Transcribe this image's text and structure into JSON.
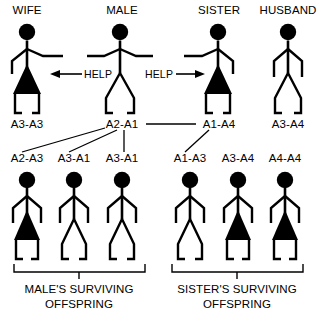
{
  "diagram": {
    "type": "pedigree-kin-selection",
    "width": 321,
    "height": 314,
    "background_color": "#ffffff",
    "ink_color": "#000000"
  },
  "parents": {
    "row_label": "parental generation",
    "figures": [
      {
        "id": "wife",
        "title": "WIFE",
        "sex": "female",
        "genotype": "A3-A3",
        "x": 27,
        "arm_style": "right-extended"
      },
      {
        "id": "male",
        "title": "MALE",
        "sex": "male",
        "genotype": "A2-A1",
        "x": 120,
        "arm_style": "both-extended"
      },
      {
        "id": "sister",
        "title": "SISTER",
        "sex": "female",
        "genotype": "A1-A4",
        "x": 218,
        "arm_style": "left-extended"
      },
      {
        "id": "husband",
        "title": "HUSBAND",
        "sex": "male",
        "genotype": "A3-A4",
        "x": 288,
        "arm_style": "normal"
      }
    ]
  },
  "help_arrows": [
    {
      "id": "help-left",
      "label": "HELP",
      "direction": "left",
      "from": "male",
      "to": "wife"
    },
    {
      "id": "help-right",
      "label": "HELP",
      "direction": "right",
      "from": "male",
      "to": "sister"
    }
  ],
  "mating_link": {
    "from": "A2-A1",
    "to": "A1-A4"
  },
  "offspring": {
    "groups": [
      {
        "id": "male-group",
        "bracket_label_line1": "MALE'S SURVIVING",
        "bracket_label_line2": "OFFSPRING",
        "children": [
          {
            "id": "child-1",
            "genotype": "A2-A3",
            "sex": "female",
            "x": 27
          },
          {
            "id": "child-2",
            "genotype": "A3-A1",
            "sex": "male",
            "x": 74
          },
          {
            "id": "child-3",
            "genotype": "A3-A1",
            "sex": "male",
            "x": 122
          }
        ]
      },
      {
        "id": "sister-group",
        "bracket_label_line1": "SISTER'S SURVIVING",
        "bracket_label_line2": "OFFSPRING",
        "children": [
          {
            "id": "child-4",
            "genotype": "A1-A3",
            "sex": "male",
            "x": 190
          },
          {
            "id": "child-5",
            "genotype": "A3-A4",
            "sex": "female",
            "x": 238
          },
          {
            "id": "child-6",
            "genotype": "A4-A4",
            "sex": "female",
            "x": 285
          }
        ]
      }
    ]
  },
  "descent_lines": [
    {
      "from": "A2-A1",
      "to": "A2-A3"
    },
    {
      "from": "A2-A1",
      "to": "A3-A1 (first)"
    },
    {
      "from": "A2-A1",
      "to": "A3-A1 (second)"
    },
    {
      "from": "A1-A4",
      "to": "A1-A3"
    }
  ]
}
